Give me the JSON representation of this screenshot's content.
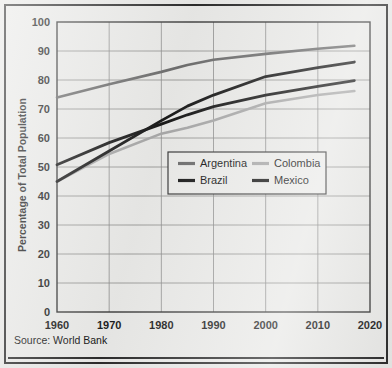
{
  "chart_data": {
    "type": "line",
    "title": "",
    "subtitle": "",
    "xlabel": "",
    "ylabel": "Percentage of Total Population",
    "xlim": [
      1960,
      2020
    ],
    "ylim": [
      0,
      100
    ],
    "x_ticks": [
      1960,
      1970,
      1980,
      1990,
      2000,
      2010,
      2020
    ],
    "y_ticks": [
      0,
      10,
      20,
      30,
      40,
      50,
      60,
      70,
      80,
      90,
      100
    ],
    "grid": true,
    "legend_position": "center",
    "source_note": "Source: World Bank",
    "series": [
      {
        "name": "Argentina",
        "color": "#6e6e6e",
        "x": [
          1960,
          1970,
          1980,
          1985,
          1990,
          2000,
          2010,
          2017
        ],
        "values": [
          74,
          78.5,
          82.8,
          85.2,
          87,
          89,
          90.8,
          91.8
        ]
      },
      {
        "name": "Brazil",
        "color": "#1a1a1a",
        "x": [
          1960,
          1970,
          1980,
          1985,
          1990,
          2000,
          2010,
          2017
        ],
        "values": [
          45,
          55.5,
          66,
          71,
          74.8,
          81.2,
          84.3,
          86.2
        ]
      },
      {
        "name": "Colombia",
        "color": "#a8a8a8",
        "x": [
          1960,
          1970,
          1980,
          1985,
          1990,
          2000,
          2010,
          2017
        ],
        "values": [
          45,
          54.5,
          61.5,
          63.5,
          66,
          72,
          74.8,
          76.2
        ]
      },
      {
        "name": "Mexico",
        "color": "#1a1a1a",
        "x": [
          1960,
          1970,
          1980,
          1985,
          1990,
          2000,
          2010,
          2017
        ],
        "values": [
          50.8,
          58.4,
          64.8,
          68,
          70.8,
          74.8,
          77.8,
          79.8
        ]
      }
    ]
  },
  "axes": {
    "y_labels": [
      "100",
      "90",
      "80",
      "70",
      "60",
      "50",
      "40",
      "30",
      "20",
      "10",
      "0"
    ],
    "x_labels": [
      "1960",
      "1970",
      "1980",
      "1990",
      "2000",
      "2010",
      "2020"
    ],
    "y_title": "Percentage of Total Population"
  },
  "legend": {
    "entries": [
      {
        "label": "Argentina",
        "color": "#6e6e6e"
      },
      {
        "label": "Colombia",
        "color": "#a8a8a8"
      },
      {
        "label": "Brazil",
        "color": "#1a1a1a"
      },
      {
        "label": "Mexico",
        "color": "#1a1a1a"
      }
    ]
  },
  "footer": {
    "source": "Source: World Bank"
  }
}
